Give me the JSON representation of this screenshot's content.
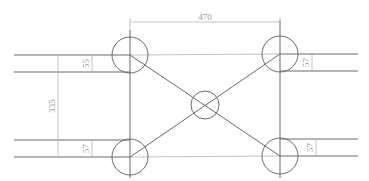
{
  "diagram": {
    "type": "technical-drawing",
    "dimensions": {
      "top_width": "470",
      "left_height": "335",
      "top_left_offset": "55",
      "bottom_left_offset": "57",
      "top_right_offset": "57",
      "bottom_right_offset": "57"
    },
    "colors": {
      "main_line": "#6a6a6a",
      "dimension_line": "#b4b4b4",
      "dimension_text": "#9a9a9a",
      "background": "#ffffff"
    }
  }
}
